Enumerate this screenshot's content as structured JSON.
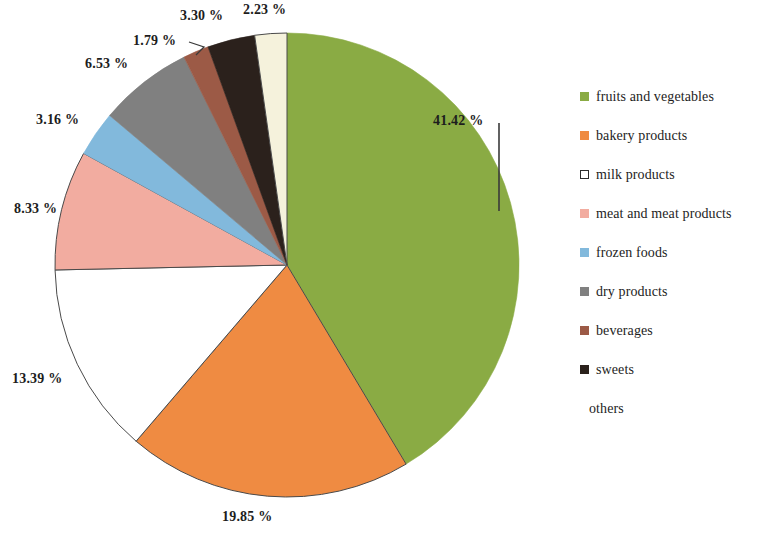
{
  "chart_data": {
    "type": "pie",
    "title": "",
    "subtitle": "",
    "xlabel": "",
    "ylabel": "",
    "legend_position": "right",
    "grid": false,
    "value_suffix": "%",
    "categories": [
      "fruits and vegetables",
      "bakery products",
      "milk products",
      "meat and meat products",
      "frozen foods",
      "dry products",
      "beverages",
      "sweets",
      "others"
    ],
    "values": [
      41.42,
      19.85,
      13.39,
      8.33,
      3.16,
      6.53,
      1.79,
      3.3,
      2.23
    ],
    "labels": [
      "41.42 %",
      "19.85 %",
      "13.39 %",
      "8.33 %",
      "3.16 %",
      "6.53 %",
      "1.79 %",
      "3.30 %",
      "2.23 %"
    ],
    "colors": [
      "#8aab44",
      "#ef8b42",
      "#ffffff",
      "#f2aca0",
      "#82b9dc",
      "#808080",
      "#9c5a46",
      "#2b211c",
      "#f5f2dc"
    ],
    "slices": [
      {
        "name": "fruits and vegetables",
        "value": 41.42,
        "label": "41.42 %",
        "color": "#8aab44"
      },
      {
        "name": "bakery products",
        "value": 19.85,
        "label": "19.85 %",
        "color": "#ef8b42"
      },
      {
        "name": "milk products",
        "value": 13.39,
        "label": "13.39 %",
        "color": "#ffffff"
      },
      {
        "name": "meat and meat products",
        "value": 8.33,
        "label": "8.33 %",
        "color": "#f2aca0"
      },
      {
        "name": "frozen foods",
        "value": 3.16,
        "label": "3.16 %",
        "color": "#82b9dc"
      },
      {
        "name": "dry products",
        "value": 6.53,
        "label": "6.53 %",
        "color": "#808080"
      },
      {
        "name": "beverages",
        "value": 1.79,
        "label": "1.79 %",
        "color": "#9c5a46"
      },
      {
        "name": "sweets",
        "value": 3.3,
        "label": "3.30 %",
        "color": "#2b211c"
      },
      {
        "name": "others",
        "value": 2.23,
        "label": "2.23 %",
        "color": "#f5f2dc"
      }
    ]
  },
  "legend": {
    "items": [
      {
        "label": "fruits and vegetables",
        "color": "#8aab44",
        "style": "filled"
      },
      {
        "label": "bakery products",
        "color": "#ef8b42",
        "style": "filled"
      },
      {
        "label": "milk products",
        "color": "#ffffff",
        "style": "outlined"
      },
      {
        "label": "meat and meat products",
        "color": "#f2aca0",
        "style": "filled"
      },
      {
        "label": "frozen foods",
        "color": "#82b9dc",
        "style": "filled"
      },
      {
        "label": "dry products",
        "color": "#808080",
        "style": "filled"
      },
      {
        "label": "beverages",
        "color": "#9c5a46",
        "style": "filled"
      },
      {
        "label": "sweets",
        "color": "#2b211c",
        "style": "filled"
      },
      {
        "label": "others",
        "color": "#f5f2dc",
        "style": "invisible"
      }
    ]
  },
  "labels": {
    "pct_41": "41.42 %",
    "pct_19": "19.85 %",
    "pct_13": "13.39 %",
    "pct_8": "8.33 %",
    "pct_3_16": "3.16 %",
    "pct_6": "6.53 %",
    "pct_1_79": "1.79 %",
    "pct_3_30": "3.30 %",
    "pct_2_23": "2.23 %"
  }
}
